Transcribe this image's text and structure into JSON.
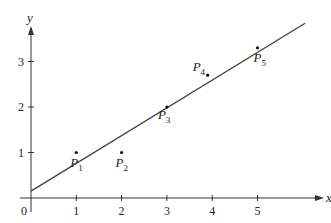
{
  "chart_data": {
    "type": "scatter",
    "title": "",
    "xlabel": "x",
    "ylabel": "y",
    "xlim": [
      0,
      6.4
    ],
    "ylim": [
      0,
      3.8
    ],
    "grid": false,
    "x_ticks": [
      "0",
      "1",
      "2",
      "3",
      "4",
      "5"
    ],
    "y_ticks": [
      "1",
      "2",
      "3"
    ],
    "points": [
      {
        "label": "P",
        "sub": "1",
        "x": 1,
        "y": 1.0
      },
      {
        "label": "P",
        "sub": "2",
        "x": 2,
        "y": 1.0
      },
      {
        "label": "P",
        "sub": "3",
        "x": 3,
        "y": 2.0
      },
      {
        "label": "P",
        "sub": "4",
        "x": 3.9,
        "y": 2.7
      },
      {
        "label": "P",
        "sub": "5",
        "x": 5,
        "y": 3.3
      }
    ],
    "fit_line": {
      "intercept": 0.15,
      "slope": 0.61,
      "x_start": 0,
      "x_end": 6.05
    }
  }
}
